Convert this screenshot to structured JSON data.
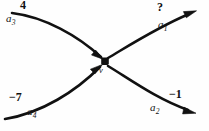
{
  "diagram": {
    "type": "flow-network-vertex",
    "vertex": {
      "name": "vertex-v",
      "label": "v",
      "shape": "filled-dot",
      "color": "#111111"
    },
    "stroke_color": "#111111",
    "background_color": "#fefefe",
    "arcs": [
      {
        "id": "a3",
        "label": "a",
        "subscript": "3",
        "value": "4",
        "direction": "incoming",
        "position": "top-left",
        "arrowhead": "at-vertex"
      },
      {
        "id": "a4",
        "label": "a",
        "subscript": "4",
        "value": "−7",
        "direction": "incoming",
        "position": "bottom-left",
        "arrowhead": "at-vertex"
      },
      {
        "id": "a1",
        "label": "a",
        "subscript": "1",
        "value": "?",
        "direction": "outgoing",
        "position": "top-right",
        "arrowhead": "at-far-end"
      },
      {
        "id": "a2",
        "label": "a",
        "subscript": "2",
        "value": "−1",
        "direction": "outgoing",
        "position": "bottom-right",
        "arrowhead": "at-far-end"
      }
    ]
  }
}
